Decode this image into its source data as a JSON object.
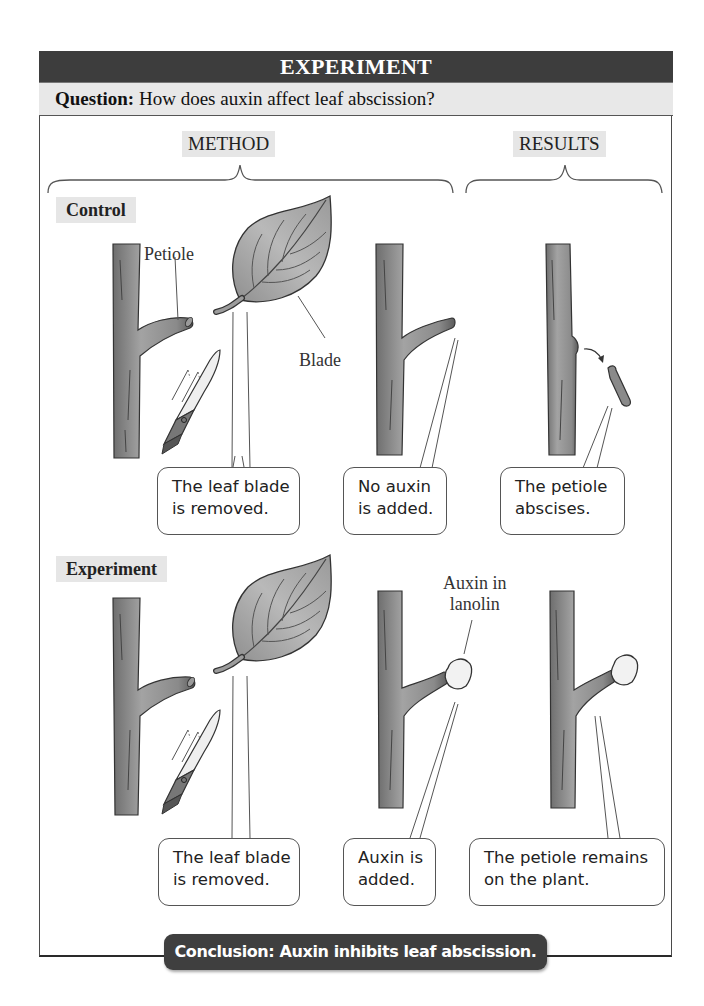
{
  "header": {
    "title": "EXPERIMENT"
  },
  "question": {
    "label": "Question:",
    "text": "How does auxin affect leaf abscission?"
  },
  "sections": {
    "method": "METHOD",
    "results": "RESULTS"
  },
  "rows": {
    "control": {
      "label": "Control",
      "annotations": {
        "petiole": "Petiole",
        "blade": "Blade"
      },
      "callouts": [
        {
          "line1": "The leaf blade",
          "line2": "is removed."
        },
        {
          "line1": "No auxin",
          "line2": "is added."
        },
        {
          "line1": "The petiole",
          "line2": "abscises."
        }
      ]
    },
    "experiment": {
      "label": "Experiment",
      "annotations": {
        "auxin_line1": "Auxin in",
        "auxin_line2": "lanolin"
      },
      "callouts": [
        {
          "line1": "The leaf blade",
          "line2": "is removed."
        },
        {
          "line1": "Auxin is",
          "line2": "added."
        },
        {
          "line1": "The petiole remains",
          "line2": "on the plant."
        }
      ]
    }
  },
  "conclusion": {
    "text": "Conclusion: Auxin inhibits leaf abscission."
  },
  "icons": [
    "stem-icon",
    "leaf-icon",
    "knife-icon",
    "lanolin-blob-icon",
    "falling-petiole-icon",
    "curved-arrow-icon"
  ],
  "colors": {
    "header_bg": "#3d3d3d",
    "question_bg": "#e8e8e8",
    "tag_bg": "#e6e6e6",
    "stem": "#8a8a8a",
    "leaf": "#a9a9a9",
    "conclusion_bg": "#3f3f3f"
  }
}
